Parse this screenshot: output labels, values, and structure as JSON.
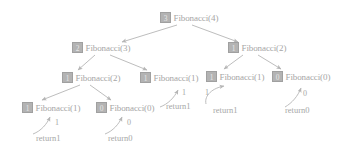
{
  "diagram": {
    "type": "recursion-tree",
    "colors": {
      "box_fill": "#b3b3b3",
      "box_border": "#a0a0a0",
      "box_text": "#e8e8e8",
      "label_text": "#a6a6a6",
      "arrow": "#b0b0b0",
      "background": "#ffffff"
    },
    "nodes": [
      {
        "id": "n0",
        "value": "3",
        "label": "Fibonacci(4)",
        "x": 160,
        "y": 12,
        "depth": 0
      },
      {
        "id": "n1",
        "value": "2",
        "label": "Fibonacci(3)",
        "x": 72,
        "y": 42,
        "depth": 1
      },
      {
        "id": "n2",
        "value": "1",
        "label": "Fibonacci(2)",
        "x": 228,
        "y": 42,
        "depth": 1
      },
      {
        "id": "n3",
        "value": "1",
        "label": "Fibonacci(2)",
        "x": 62,
        "y": 72,
        "depth": 2
      },
      {
        "id": "n4",
        "value": "1",
        "label": "Fibonacci(1)",
        "x": 140,
        "y": 72,
        "depth": 2
      },
      {
        "id": "n5",
        "value": "1",
        "label": "Fibonacci(1)",
        "x": 206,
        "y": 71,
        "depth": 2
      },
      {
        "id": "n6",
        "value": "0",
        "label": "Fibonacci(0)",
        "x": 272,
        "y": 71,
        "depth": 2
      },
      {
        "id": "n7",
        "value": "1",
        "label": "Fibonacci(1)",
        "x": 22,
        "y": 102,
        "depth": 3
      },
      {
        "id": "n8",
        "value": "0",
        "label": "Fibonacci(0)",
        "x": 96,
        "y": 102,
        "depth": 3
      }
    ],
    "edges": [
      {
        "from": "n0",
        "to": "n1"
      },
      {
        "from": "n0",
        "to": "n2"
      },
      {
        "from": "n1",
        "to": "n3"
      },
      {
        "from": "n1",
        "to": "n4"
      },
      {
        "from": "n2",
        "to": "n5"
      },
      {
        "from": "n2",
        "to": "n6"
      },
      {
        "from": "n3",
        "to": "n7"
      },
      {
        "from": "n3",
        "to": "n8"
      }
    ],
    "returns": [
      {
        "id": "r0",
        "text": "return1",
        "value": "1",
        "for": "n4",
        "x": 166,
        "y": 101,
        "num_x": 182,
        "num_y": 88
      },
      {
        "id": "r1",
        "text": "return1",
        "value": "1",
        "for": "n5",
        "x": 213,
        "y": 105,
        "num_x": 205,
        "num_y": 88
      },
      {
        "id": "r2",
        "text": "return0",
        "value": "0",
        "for": "n6",
        "x": 285,
        "y": 105,
        "num_x": 303,
        "num_y": 89
      },
      {
        "id": "r3",
        "text": "return1",
        "value": "1",
        "for": "n7",
        "x": 36,
        "y": 133,
        "num_x": 55,
        "num_y": 118
      },
      {
        "id": "r4",
        "text": "return0",
        "value": "0",
        "for": "n8",
        "x": 108,
        "y": 133,
        "num_x": 127,
        "num_y": 118
      }
    ]
  }
}
